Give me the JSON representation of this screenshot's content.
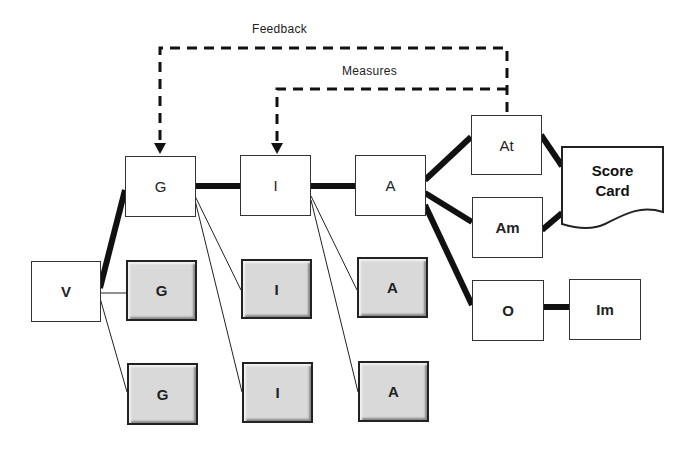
{
  "labels": {
    "feedback": "Feedback",
    "measures": "Measures"
  },
  "nodes": {
    "v": "V",
    "g_top": "G",
    "g_mid": "G",
    "g_bot": "G",
    "i_top": "I",
    "i_mid": "I",
    "i_bot": "I",
    "a_top": "A",
    "a_mid": "A",
    "a_bot": "A",
    "at": "At",
    "am": "Am",
    "o": "O",
    "im": "Im",
    "score_card_line1": "Score",
    "score_card_line2": "Card"
  },
  "colors": {
    "line": "#111111",
    "shaded_fill": "#d9d9d9",
    "border": "#333333"
  }
}
